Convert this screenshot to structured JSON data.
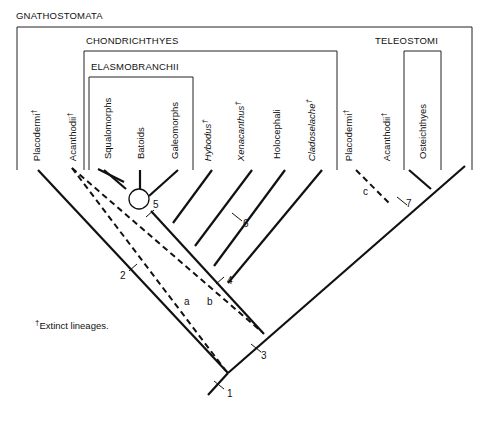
{
  "groups": {
    "gnathostomata": "GNATHOSTOMATA",
    "chondrichthyes": "CHONDRICHTHYES",
    "elasmobranchii": "ELASMOBRANCHII",
    "teleostomi": "TELEOSTOMI"
  },
  "taxa": [
    {
      "name": "Placodermi",
      "dagger": "†",
      "italic": false
    },
    {
      "name": "Acanthodii",
      "dagger": "†",
      "italic": false
    },
    {
      "name": "Squalomorphs",
      "dagger": "",
      "italic": false
    },
    {
      "name": "Batoids",
      "dagger": "",
      "italic": false
    },
    {
      "name": "Galeomorphs",
      "dagger": "",
      "italic": false
    },
    {
      "name": "Hybodus",
      "dagger": "†",
      "italic": true
    },
    {
      "name": "Xenacanthus",
      "dagger": "†",
      "italic": true
    },
    {
      "name": "Holocephali",
      "dagger": "",
      "italic": false
    },
    {
      "name": "Cladoselache",
      "dagger": "†",
      "italic": true
    },
    {
      "name": "Placodermi",
      "dagger": "†",
      "italic": false
    },
    {
      "name": "Acanthodii",
      "dagger": "†",
      "italic": false
    },
    {
      "name": "Osteichthyes",
      "dagger": "",
      "italic": false
    }
  ],
  "nodes": [
    "1",
    "2",
    "3",
    "4",
    "5",
    "6",
    "7"
  ],
  "alt_lineages": [
    "a",
    "b",
    "c"
  ],
  "footnote": {
    "dagger": "†",
    "text": "Extinct lineages."
  }
}
